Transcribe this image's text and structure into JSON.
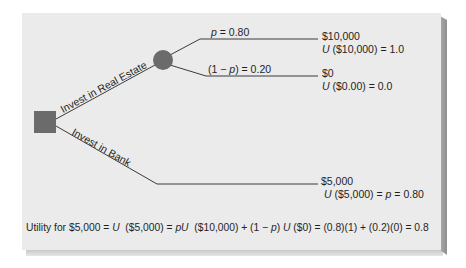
{
  "diagram": {
    "type": "decision-tree",
    "colors": {
      "background": "#ffffff",
      "card": "#ebebeb",
      "card_bevel": "#9a9a9a",
      "node_fill": "#6b6b6b",
      "line": "#3a3a3a",
      "text": "#1f1f1f"
    },
    "decision_node": {
      "shape": "square",
      "label": ""
    },
    "chance_node": {
      "shape": "circle",
      "label": ""
    },
    "branches": {
      "real_estate": {
        "label": "Invest in Real Estate"
      },
      "bank": {
        "label": "Invest in Bank"
      }
    },
    "outcomes": {
      "win": {
        "prob_label_p": "p",
        "prob_label_rest": " = 0.80",
        "value": "$10,000",
        "utility_u": "U",
        "utility_rest": " ($10,000) = 1.0"
      },
      "lose": {
        "prob_label_pre": "(1 − ",
        "prob_label_p": "p",
        "prob_label_rest": ") = 0.20",
        "value": "$0",
        "utility_u": "U",
        "utility_rest": " ($0.00) = 0.0"
      },
      "bank": {
        "value": "$5,000",
        "utility_u": "U",
        "utility_mid": " ($5,000) = ",
        "utility_p": "p",
        "utility_rest": " = 0.80"
      }
    },
    "formula": {
      "part1": "Utility for $5,000 = ",
      "u1": "U",
      "part2": "  ($5,000) = ",
      "pu": "pU",
      "part3": "  ($10,000) + (1 − ",
      "p": "p",
      "part4": ") ",
      "u2": "U",
      "part5": " ($0) = (0.8)(1) + (0.2)(0) = 0.8"
    }
  }
}
